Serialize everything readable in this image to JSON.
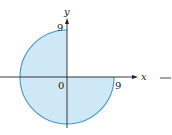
{
  "figure": {
    "region": {
      "shape": "three-quarter disk",
      "radius": 9,
      "center": [
        0,
        0
      ],
      "quadrants": [
        "II",
        "III",
        "IV"
      ],
      "fill_color": "#cfe8f5",
      "edge_color": "#3a9ad0"
    },
    "axes": {
      "x_label": "x",
      "y_label": "y",
      "origin_label": "0",
      "x_tick_label": "9",
      "y_tick_label": "9",
      "axis_color": "#222222"
    },
    "trailing_mark": "—"
  }
}
